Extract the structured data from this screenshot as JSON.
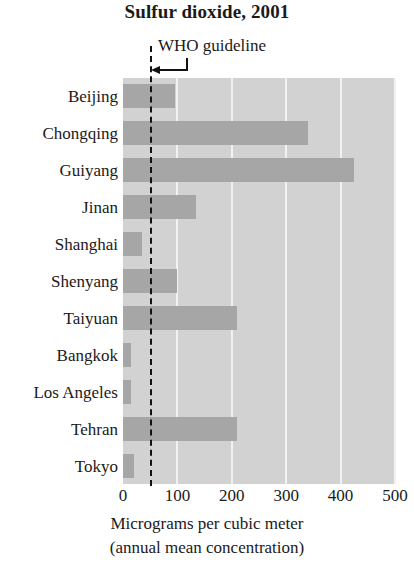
{
  "chart_data": {
    "type": "bar",
    "orientation": "horizontal",
    "title": "Sulfur dioxide, 2001",
    "xlabel": "Micrograms per cubic meter",
    "xlabel_sub": "(annual mean concentration)",
    "ylabel": "",
    "xlim": [
      0,
      500
    ],
    "xticks": [
      0,
      100,
      200,
      300,
      400,
      500
    ],
    "xtick_labels": [
      "0",
      "100",
      "200",
      "300",
      "400",
      "500"
    ],
    "grid": "vertical-gridlines-white",
    "legend": "none",
    "categories": [
      "Beijing",
      "Chongqing",
      "Guiyang",
      "Jinan",
      "Shanghai",
      "Shenyang",
      "Taiyuan",
      "Bangkok",
      "Los Angeles",
      "Tehran",
      "Tokyo"
    ],
    "values": [
      95,
      340,
      425,
      135,
      35,
      100,
      210,
      15,
      15,
      210,
      20
    ],
    "annotations": [
      {
        "name": "who-guideline",
        "label": "WHO guideline",
        "value": 50,
        "style": "dashed-vertical-line-with-left-arrow"
      }
    ],
    "colors": {
      "bar": "#a6a6a6",
      "plot_background": "#d2d2d2",
      "gridline": "#f2f2f2",
      "text": "#1a1a1a",
      "threshold_line": "#121212",
      "page_background": "#ffffff"
    }
  }
}
